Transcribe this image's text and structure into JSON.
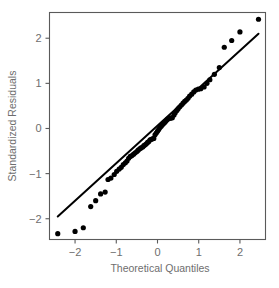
{
  "chart_data": {
    "type": "scatter",
    "title": "",
    "xlabel": "Theoretical Quantiles",
    "ylabel": "Standardized Residuals",
    "xlim": [
      -2.62,
      2.62
    ],
    "ylim": [
      -2.46,
      2.57
    ],
    "xticks": [
      -2,
      -1,
      0,
      1,
      2
    ],
    "xticklabels": [
      "−2",
      "−1",
      "0",
      "1",
      "2"
    ],
    "yticks": [
      -2,
      -1,
      0,
      1,
      2
    ],
    "yticklabels": [
      "−2",
      "−1",
      "0",
      "1",
      "2"
    ],
    "grid": false,
    "legend": null,
    "point_color": "#000000",
    "line_color": "#000000",
    "frame_color": "#5a5a5a",
    "text_color": "#6e6e6e",
    "background": "#ffffff",
    "reference_line": {
      "name": "qq-reference-line",
      "x": [
        -2.42,
        2.45
      ],
      "y": [
        -1.95,
        2.1
      ]
    },
    "series": [
      {
        "name": "standardized-residuals",
        "marker": "filled-circle",
        "marker_size": 4.0,
        "points": [
          [
            -2.42,
            -2.33
          ],
          [
            -2.0,
            -2.28
          ],
          [
            -1.8,
            -2.2
          ],
          [
            -1.62,
            -1.73
          ],
          [
            -1.5,
            -1.6
          ],
          [
            -1.38,
            -1.45
          ],
          [
            -1.27,
            -1.41
          ],
          [
            -1.2,
            -1.13
          ],
          [
            -1.13,
            -1.1
          ],
          [
            -1.05,
            -1.02
          ],
          [
            -0.99,
            -0.95
          ],
          [
            -0.93,
            -0.9
          ],
          [
            -0.88,
            -0.86
          ],
          [
            -0.83,
            -0.8
          ],
          [
            -0.78,
            -0.76
          ],
          [
            -0.74,
            -0.72
          ],
          [
            -0.7,
            -0.66
          ],
          [
            -0.66,
            -0.62
          ],
          [
            -0.62,
            -0.6
          ],
          [
            -0.58,
            -0.57
          ],
          [
            -0.54,
            -0.54
          ],
          [
            -0.5,
            -0.51
          ],
          [
            -0.47,
            -0.48
          ],
          [
            -0.43,
            -0.45
          ],
          [
            -0.4,
            -0.43
          ],
          [
            -0.36,
            -0.41
          ],
          [
            -0.33,
            -0.38
          ],
          [
            -0.3,
            -0.36
          ],
          [
            -0.27,
            -0.34
          ],
          [
            -0.24,
            -0.31
          ],
          [
            -0.21,
            -0.29
          ],
          [
            -0.18,
            -0.25
          ],
          [
            -0.15,
            -0.24
          ],
          [
            -0.12,
            -0.23
          ],
          [
            -0.09,
            -0.22
          ],
          [
            -0.06,
            -0.14
          ],
          [
            -0.03,
            -0.1
          ],
          [
            0.0,
            -0.06
          ],
          [
            0.03,
            -0.02
          ],
          [
            0.06,
            0.02
          ],
          [
            0.09,
            0.05
          ],
          [
            0.12,
            0.08
          ],
          [
            0.15,
            0.11
          ],
          [
            0.18,
            0.14
          ],
          [
            0.21,
            0.17
          ],
          [
            0.24,
            0.2
          ],
          [
            0.27,
            0.22
          ],
          [
            0.3,
            0.23
          ],
          [
            0.33,
            0.23
          ],
          [
            0.36,
            0.24
          ],
          [
            0.4,
            0.3
          ],
          [
            0.43,
            0.35
          ],
          [
            0.47,
            0.4
          ],
          [
            0.5,
            0.44
          ],
          [
            0.54,
            0.48
          ],
          [
            0.58,
            0.52
          ],
          [
            0.62,
            0.56
          ],
          [
            0.66,
            0.6
          ],
          [
            0.7,
            0.63
          ],
          [
            0.74,
            0.67
          ],
          [
            0.78,
            0.72
          ],
          [
            0.83,
            0.76
          ],
          [
            0.88,
            0.81
          ],
          [
            0.93,
            0.85
          ],
          [
            0.99,
            0.87
          ],
          [
            1.05,
            0.88
          ],
          [
            1.13,
            0.92
          ],
          [
            1.2,
            1.0
          ],
          [
            1.27,
            1.08
          ],
          [
            1.38,
            1.2
          ],
          [
            1.5,
            1.35
          ],
          [
            1.62,
            1.8
          ],
          [
            1.8,
            1.95
          ],
          [
            2.0,
            2.14
          ],
          [
            2.45,
            2.42
          ]
        ]
      }
    ]
  }
}
